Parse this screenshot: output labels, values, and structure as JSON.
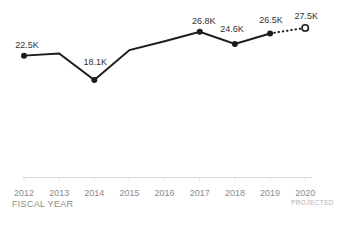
{
  "chart_data": {
    "type": "line",
    "title": "",
    "x": [
      "2012",
      "2013",
      "2014",
      "2015",
      "2016",
      "2017",
      "2018",
      "2019",
      "2020"
    ],
    "series": [
      {
        "name": "fiscal-year-values",
        "values": [
          22.5,
          22.9,
          18.1,
          23.5,
          25.1,
          26.8,
          24.6,
          26.5,
          27.5
        ]
      }
    ],
    "value_labels": [
      "22.5K",
      null,
      "18.1K",
      null,
      null,
      "26.8K",
      "24.6K",
      "26.5K",
      "27.5K"
    ],
    "unit": "K",
    "xlabel": "FISCAL YEAR",
    "ylabel": "",
    "ylim": [
      0,
      30
    ],
    "grid": false,
    "legend_position": "none",
    "projected_index": 8,
    "projected_label": "PROJECTED"
  },
  "colors": {
    "line": "#1c1c1c",
    "point": "#1c1c1c",
    "projected_point_fill": "#ffffff",
    "axis": "#dcdcdc",
    "value_label": "#333333",
    "tick_label": "#8c8c8c",
    "axis_label": "#8c8c8c",
    "projected_text": "#b3b3b3",
    "background": "#ffffff"
  }
}
